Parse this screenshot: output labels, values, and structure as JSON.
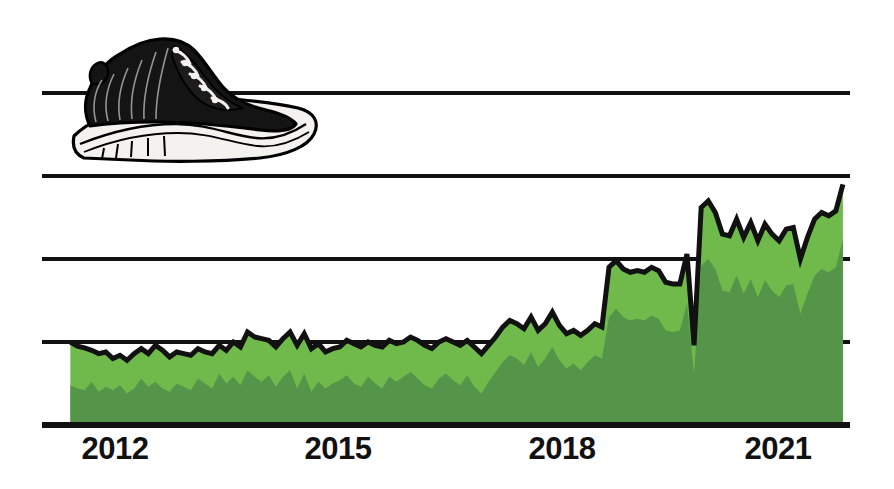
{
  "figure": {
    "title": "",
    "background": "#ffffff",
    "illustration": {
      "name": "black-high-top-sneaker",
      "description": "Black high-top basketball sneaker with white midsole and white laces",
      "upper_color": "#111111",
      "sole_color": "#f2f0ec",
      "outline_color": "#000000"
    }
  },
  "chart_data": {
    "type": "area",
    "title": "",
    "xlabel": "",
    "ylabel": "",
    "grid": true,
    "legend_position": "none",
    "xlim": [
      2011.0,
      2022.4
    ],
    "ylim": [
      0,
      5
    ],
    "axis_tick_labels": [
      "2012",
      "2015",
      "2018",
      "2021"
    ],
    "axis_tick_positions": [
      2012,
      2015,
      2018,
      2021
    ],
    "gridline_values": [
      1,
      2,
      3,
      4
    ],
    "colors": {
      "series_upper": "#6fba4b",
      "series_lower": "#55954a",
      "outline": "#111111",
      "gridline": "#111111",
      "baseline": "#111111"
    },
    "x": [
      2011.4,
      2011.5,
      2011.6,
      2011.7,
      2011.8,
      2011.9,
      2012.0,
      2012.1,
      2012.2,
      2012.3,
      2012.4,
      2012.5,
      2012.6,
      2012.7,
      2012.8,
      2012.9,
      2013.0,
      2013.1,
      2013.2,
      2013.3,
      2013.4,
      2013.5,
      2013.6,
      2013.7,
      2013.8,
      2013.9,
      2014.0,
      2014.1,
      2014.2,
      2014.3,
      2014.4,
      2014.5,
      2014.6,
      2014.7,
      2014.8,
      2014.9,
      2015.0,
      2015.1,
      2015.2,
      2015.3,
      2015.4,
      2015.5,
      2015.6,
      2015.7,
      2015.8,
      2015.9,
      2016.0,
      2016.1,
      2016.2,
      2016.3,
      2016.4,
      2016.5,
      2016.6,
      2016.7,
      2016.8,
      2016.9,
      2017.0,
      2017.1,
      2017.2,
      2017.3,
      2017.4,
      2017.5,
      2017.6,
      2017.7,
      2017.8,
      2017.9,
      2018.0,
      2018.1,
      2018.2,
      2018.3,
      2018.4,
      2018.5,
      2018.6,
      2018.7,
      2018.8,
      2018.9,
      2019.0,
      2019.1,
      2019.2,
      2019.3,
      2019.4,
      2019.5,
      2019.6,
      2019.7,
      2019.8,
      2019.9,
      2020.0,
      2020.1,
      2020.2,
      2020.3,
      2020.4,
      2020.5,
      2020.6,
      2020.7,
      2020.8,
      2020.9,
      2021.0,
      2021.1,
      2021.2,
      2021.3,
      2021.4,
      2021.5,
      2021.6,
      2021.7,
      2021.8,
      2021.9,
      2022.0,
      2022.1,
      2022.2,
      2022.3
    ],
    "series": [
      {
        "name": "upper-area",
        "color": "#6fba4b",
        "values": [
          1.0,
          0.95,
          0.93,
          0.9,
          0.86,
          0.88,
          0.8,
          0.84,
          0.78,
          0.86,
          0.92,
          0.86,
          0.96,
          0.9,
          0.82,
          0.88,
          0.86,
          0.84,
          0.92,
          0.88,
          0.86,
          0.96,
          0.9,
          1.0,
          0.94,
          1.12,
          1.06,
          1.04,
          1.02,
          0.94,
          1.04,
          1.12,
          0.96,
          1.1,
          0.92,
          0.98,
          0.88,
          0.92,
          0.94,
          1.02,
          0.98,
          0.94,
          1.0,
          0.96,
          0.94,
          1.02,
          0.98,
          1.0,
          1.06,
          1.02,
          0.96,
          0.92,
          1.0,
          1.04,
          1.0,
          0.96,
          1.02,
          0.94,
          0.86,
          0.96,
          1.06,
          1.18,
          1.26,
          1.22,
          1.16,
          1.3,
          1.14,
          1.22,
          1.36,
          1.2,
          1.1,
          1.14,
          1.08,
          1.14,
          1.22,
          1.18,
          1.9,
          1.98,
          1.88,
          1.84,
          1.86,
          1.84,
          1.9,
          1.86,
          1.72,
          1.7,
          1.7,
          2.06,
          0.96,
          2.62,
          2.7,
          2.56,
          2.3,
          2.28,
          2.48,
          2.26,
          2.44,
          2.22,
          2.42,
          2.3,
          2.22,
          2.36,
          2.38,
          2.0,
          2.26,
          2.48,
          2.56,
          2.52,
          2.58,
          2.9
        ]
      },
      {
        "name": "lower-area",
        "color": "#55954a",
        "values": [
          0.48,
          0.44,
          0.42,
          0.52,
          0.4,
          0.46,
          0.42,
          0.48,
          0.38,
          0.44,
          0.56,
          0.46,
          0.52,
          0.44,
          0.4,
          0.5,
          0.46,
          0.42,
          0.56,
          0.5,
          0.44,
          0.62,
          0.5,
          0.58,
          0.48,
          0.66,
          0.58,
          0.52,
          0.6,
          0.46,
          0.58,
          0.66,
          0.44,
          0.62,
          0.4,
          0.52,
          0.44,
          0.5,
          0.54,
          0.6,
          0.5,
          0.46,
          0.58,
          0.5,
          0.44,
          0.58,
          0.52,
          0.58,
          0.64,
          0.56,
          0.48,
          0.44,
          0.56,
          0.62,
          0.54,
          0.48,
          0.6,
          0.46,
          0.38,
          0.52,
          0.64,
          0.76,
          0.84,
          0.8,
          0.72,
          0.88,
          0.7,
          0.8,
          0.94,
          0.78,
          0.68,
          0.74,
          0.66,
          0.76,
          0.84,
          0.8,
          1.3,
          1.4,
          1.3,
          1.26,
          1.28,
          1.26,
          1.32,
          1.28,
          1.14,
          1.12,
          1.14,
          1.46,
          0.62,
          1.92,
          2.0,
          1.88,
          1.62,
          1.6,
          1.8,
          1.58,
          1.76,
          1.54,
          1.74,
          1.62,
          1.54,
          1.68,
          1.7,
          1.34,
          1.58,
          1.8,
          1.88,
          1.84,
          1.9,
          2.24
        ]
      }
    ]
  },
  "axis": {
    "ticks": [
      {
        "label": "2012",
        "value": 2012
      },
      {
        "label": "2015",
        "value": 2015
      },
      {
        "label": "2018",
        "value": 2018
      },
      {
        "label": "2021",
        "value": 2021
      }
    ]
  }
}
